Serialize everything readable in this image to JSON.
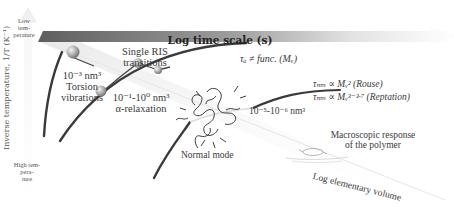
{
  "diagram": {
    "time_axis_label": "Log time scale (s)",
    "y_axis_label": "Inverse temperature, 1/T (K⁻¹)",
    "y_axis_top": [
      "Low",
      "tem-",
      "perature"
    ],
    "y_axis_bottom": [
      "High tem-",
      "pera-",
      "ture"
    ],
    "volume_axis_label": "Log elementary volume",
    "regions": [
      {
        "id": "torsion",
        "volume": "10⁻³ nm³",
        "name_lines": [
          "Torsion",
          "vibrations"
        ]
      },
      {
        "id": "ris",
        "name_lines": [
          "Single RIS",
          "transitions"
        ]
      },
      {
        "id": "alpha",
        "volume": "10⁻¹-10⁰ nm³",
        "name": "α-relaxation"
      },
      {
        "id": "normal",
        "volume": "10⁻⁵-10⁻⁶ nm³",
        "name": "Normal mode"
      },
      {
        "id": "macro",
        "name_lines": [
          "Macroscopic response",
          "of the polymer"
        ]
      }
    ],
    "annotations": {
      "tau_alpha": "τₐ ≠ func. (Mᵥ)",
      "tau_rouse": "τₙₘ ∝ Mᵥ² (Rouse)",
      "tau_reptation": "τₙₘ ∝ Mᵥ³⁻³·⁷ (Reptation)"
    },
    "colors": {
      "timebar_dark": "#6a6a6a",
      "timebar_light": "#f4f4f4",
      "curve": "#3a3a3a",
      "sphere": "#b8b8b8"
    }
  }
}
